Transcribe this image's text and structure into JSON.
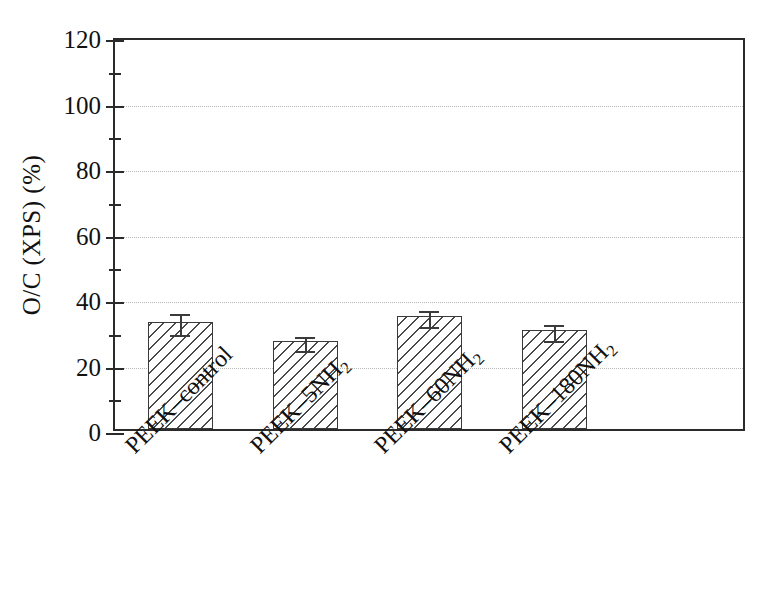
{
  "chart_data": {
    "type": "bar",
    "title": "",
    "xlabel": "",
    "ylabel": "O/C (XPS) (%)",
    "categories": [
      "PEEK–control",
      "PEEK–5NH₂",
      "PEEK–60NH₂",
      "PEEK–180NH₂"
    ],
    "values": [
      32.7,
      26.8,
      34.5,
      30.2
    ],
    "errors": [
      3.5,
      2.5,
      2.8,
      2.8
    ],
    "ylim": [
      0,
      120
    ],
    "yticks": [
      0,
      20,
      40,
      60,
      80,
      100,
      120
    ],
    "ytick_labels": [
      "0",
      "20",
      "40",
      "60",
      "80",
      "100",
      "120"
    ],
    "yminor_ticks": [
      10,
      30,
      50,
      70,
      90,
      110
    ],
    "grid": true,
    "grid_axis": "y",
    "legend": null,
    "bar_fill": "hatch-diagonal",
    "bar_color": "#ffffff",
    "bar_edge_color": "#3a3a3a",
    "error_bar_color": "#3b3b3b",
    "grid_color": "#b9b9b9",
    "axis_color": "#2b2b2b",
    "xtick_label_rotation": -45
  },
  "axis": {
    "ylabel_text": "O/C (XPS) (%)"
  },
  "xticks": {
    "labels": [
      {
        "prefix": "PEEK–control",
        "sub": ""
      },
      {
        "prefix": "PEEK–5NH",
        "sub": "2"
      },
      {
        "prefix": "PEEK–60NH",
        "sub": "2"
      },
      {
        "prefix": "PEEK–180NH",
        "sub": "2"
      }
    ]
  }
}
